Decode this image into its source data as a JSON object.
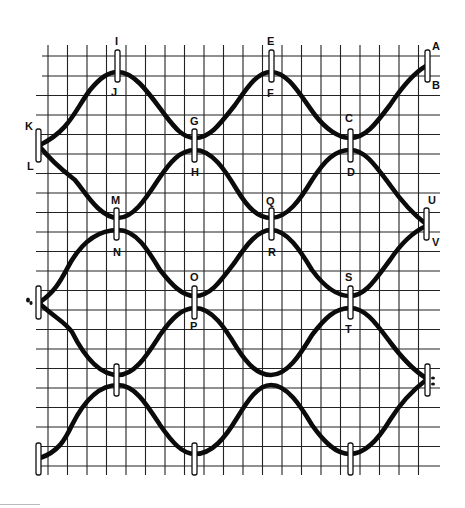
{
  "diagram": {
    "type": "braided wire / cable lacing diagram on grid paper",
    "grid": {
      "cols": 20,
      "rows": 21,
      "x0": 48,
      "x1": 437,
      "y0": 55,
      "y1": 467,
      "color": "#222222"
    },
    "line_color": "#0b0b0b",
    "labels": {
      "A": "A",
      "B": "B",
      "C": "C",
      "D": "D",
      "E": "E",
      "F": "F",
      "G": "G",
      "H": "H",
      "I": "I",
      "J": "J",
      "K": "K",
      "L": "L",
      "M": "M",
      "N": "N",
      "O": "O",
      "P": "P",
      "Q": "Q",
      "R": "R",
      "S": "S",
      "T": "T",
      "U": "U",
      "V": "V"
    },
    "clips": [
      {
        "id": "IJ",
        "top_label": "I",
        "bottom_label": "J"
      },
      {
        "id": "EF",
        "top_label": "E",
        "bottom_label": "F"
      },
      {
        "id": "AB",
        "top_label": "A",
        "bottom_label": "B"
      },
      {
        "id": "KL",
        "top_label": "K",
        "bottom_label": "L"
      },
      {
        "id": "GH",
        "top_label": "G",
        "bottom_label": "H"
      },
      {
        "id": "CD",
        "top_label": "C",
        "bottom_label": "D"
      },
      {
        "id": "MN",
        "top_label": "M",
        "bottom_label": "N"
      },
      {
        "id": "QR",
        "top_label": "Q",
        "bottom_label": "R"
      },
      {
        "id": "UV",
        "top_label": "U",
        "bottom_label": "V"
      },
      {
        "id": "OP",
        "top_label": "O",
        "bottom_label": "P"
      },
      {
        "id": "ST",
        "top_label": "S",
        "bottom_label": "T"
      }
    ]
  }
}
